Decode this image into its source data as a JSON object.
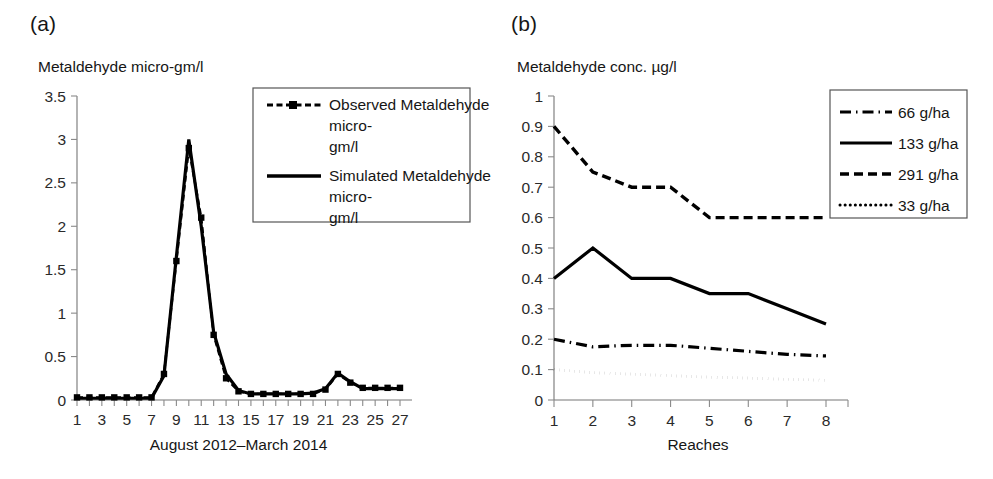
{
  "figure": {
    "panels": [
      {
        "key": "a",
        "label": "(a)",
        "y_axis_title": "Metaldehyde micro-gm/l",
        "x_axis_title": "August 2012–March 2014",
        "y_ticks": [
          "0",
          "0.5",
          "1",
          "1.5",
          "2",
          "2.5",
          "3",
          "3.5"
        ],
        "x_ticks": [
          "1",
          "3",
          "5",
          "7",
          "9",
          "11",
          "13",
          "15",
          "17",
          "19",
          "21",
          "23",
          "25",
          "27"
        ],
        "legend": [
          {
            "label": "Observed Metaldehyde micro-gm/l",
            "style": "dash-dot-marker"
          },
          {
            "label": "Simulated Metaldehyde micro-gm/l",
            "style": "solid"
          }
        ]
      },
      {
        "key": "b",
        "label": "(b)",
        "y_axis_title": "Metaldehyde conc. µg/l",
        "x_axis_title": "Reaches",
        "y_ticks": [
          "0",
          "0.1",
          "0.2",
          "0.3",
          "0.4",
          "0.5",
          "0.6",
          "0.7",
          "0.8",
          "0.9",
          "1"
        ],
        "x_ticks": [
          "1",
          "2",
          "3",
          "4",
          "5",
          "6",
          "7",
          "8"
        ],
        "legend": [
          {
            "label": "66 g/ha",
            "style": "dash-dot"
          },
          {
            "label": "133 g/ha",
            "style": "solid"
          },
          {
            "label": "291 g/ha",
            "style": "dashed"
          },
          {
            "label": "33 g/ha",
            "style": "dotted"
          }
        ]
      }
    ]
  },
  "chart_data": [
    {
      "panel": "a",
      "type": "line",
      "title": "(a)",
      "xlabel": "August 2012–March 2014",
      "ylabel": "Metaldehyde micro-gm/l",
      "xlim": [
        1,
        27
      ],
      "ylim": [
        0,
        3.5
      ],
      "ytick_step": 0.5,
      "grid": false,
      "legend_position": "inside-top-right",
      "x": [
        1,
        2,
        3,
        4,
        5,
        6,
        7,
        8,
        9,
        10,
        11,
        12,
        13,
        14,
        15,
        16,
        17,
        18,
        19,
        20,
        21,
        22,
        23,
        24,
        25,
        26,
        27
      ],
      "series": [
        {
          "name": "Observed Metaldehyde micro-gm/l",
          "style": "dash-dot-marker",
          "markers": true,
          "values": [
            0.03,
            0.03,
            0.03,
            0.03,
            0.03,
            0.03,
            0.03,
            0.3,
            1.6,
            2.9,
            2.1,
            0.75,
            0.25,
            0.1,
            0.07,
            0.07,
            0.07,
            0.07,
            0.07,
            0.07,
            0.12,
            0.3,
            0.2,
            0.14,
            0.14,
            0.14,
            0.14
          ]
        },
        {
          "name": "Simulated Metaldehyde micro-gm/l",
          "style": "solid",
          "markers": false,
          "values": [
            0.02,
            0.02,
            0.02,
            0.02,
            0.02,
            0.02,
            0.02,
            0.28,
            1.65,
            3.0,
            2.0,
            0.78,
            0.3,
            0.11,
            0.07,
            0.07,
            0.07,
            0.07,
            0.07,
            0.08,
            0.13,
            0.31,
            0.21,
            0.13,
            0.13,
            0.13,
            0.13
          ]
        }
      ]
    },
    {
      "panel": "b",
      "type": "line",
      "title": "(b)",
      "xlabel": "Reaches",
      "ylabel": "Metaldehyde conc. µg/l",
      "xlim": [
        1,
        8
      ],
      "ylim": [
        0,
        1
      ],
      "ytick_step": 0.1,
      "grid": false,
      "legend_position": "outside-top-right",
      "x": [
        1,
        2,
        3,
        4,
        5,
        6,
        7,
        8
      ],
      "series": [
        {
          "name": "66 g/ha",
          "style": "dash-dot",
          "values": [
            0.2,
            0.175,
            0.18,
            0.18,
            0.17,
            0.16,
            0.15,
            0.145
          ]
        },
        {
          "name": "133 g/ha",
          "style": "solid",
          "values": [
            0.4,
            0.5,
            0.4,
            0.4,
            0.35,
            0.35,
            0.3,
            0.25
          ]
        },
        {
          "name": "291 g/ha",
          "style": "dashed",
          "values": [
            0.9,
            0.75,
            0.7,
            0.7,
            0.6,
            0.6,
            0.6,
            0.6
          ]
        },
        {
          "name": "33 g/ha",
          "style": "dotted",
          "values": [
            0.1,
            0.09,
            0.085,
            0.08,
            0.075,
            0.072,
            0.068,
            0.065
          ]
        }
      ]
    }
  ]
}
